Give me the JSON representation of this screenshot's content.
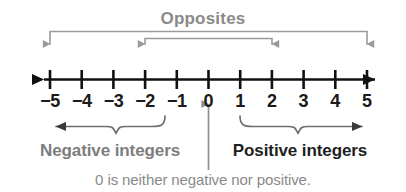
{
  "figure": {
    "title": "Opposites",
    "note": "0 is neither negative nor positive.",
    "axis": {
      "labels": [
        "−5",
        "−4",
        "−3",
        "−2",
        "−1",
        "0",
        "1",
        "2",
        "3",
        "4",
        "5"
      ],
      "values": [
        -5,
        -4,
        -3,
        -2,
        -1,
        0,
        1,
        2,
        3,
        4,
        5
      ]
    },
    "groups": {
      "negative_label": "Negative integers",
      "positive_label": "Positive integers"
    },
    "opposite_pairs": [
      {
        "left": "−5",
        "right": "5"
      },
      {
        "left": "−2",
        "right": "2"
      }
    ],
    "colors": {
      "axis": "#111111",
      "annotation_gray": "#8a8a8a",
      "label_dark": "#1a1a1a",
      "background": "#ffffff"
    }
  }
}
